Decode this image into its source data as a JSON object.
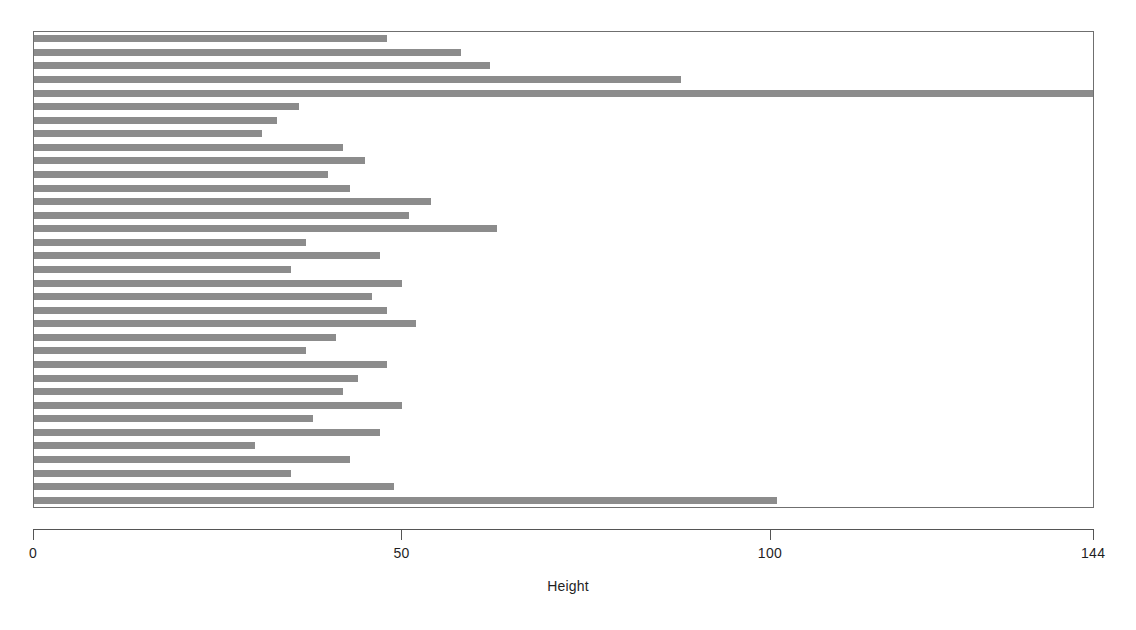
{
  "chart_data": {
    "type": "bar",
    "orientation": "horizontal",
    "title": "",
    "xlabel": "Height",
    "ylabel": "",
    "xlim": [
      0,
      144
    ],
    "grid": false,
    "legend": null,
    "bar_color": "#8c8c8c",
    "background_color": "#ffffff",
    "axis_color": "#555555",
    "xticks": [
      0,
      50,
      100,
      144
    ],
    "xticklabels": [
      "0",
      "50",
      "100",
      "144"
    ],
    "categories": [
      "1",
      "2",
      "3",
      "4",
      "5",
      "6",
      "7",
      "8",
      "9",
      "10",
      "11",
      "12",
      "13",
      "14",
      "15",
      "16",
      "17",
      "18",
      "19",
      "20",
      "21",
      "22",
      "23",
      "24",
      "25",
      "26",
      "27",
      "28",
      "29",
      "30",
      "31",
      "32",
      "33",
      "34",
      "35"
    ],
    "values": [
      48,
      58,
      62,
      88,
      144,
      36,
      33,
      31,
      42,
      45,
      40,
      43,
      54,
      51,
      63,
      37,
      47,
      35,
      50,
      46,
      48,
      52,
      41,
      37,
      48,
      44,
      42,
      50,
      38,
      47,
      30,
      43,
      35,
      49,
      101
    ],
    "n_bars": 35,
    "bar_thickness_units": 0.5
  },
  "axis": {
    "label": "Height",
    "tick_0": "0",
    "tick_50": "50",
    "tick_100": "100",
    "tick_144": "144"
  }
}
